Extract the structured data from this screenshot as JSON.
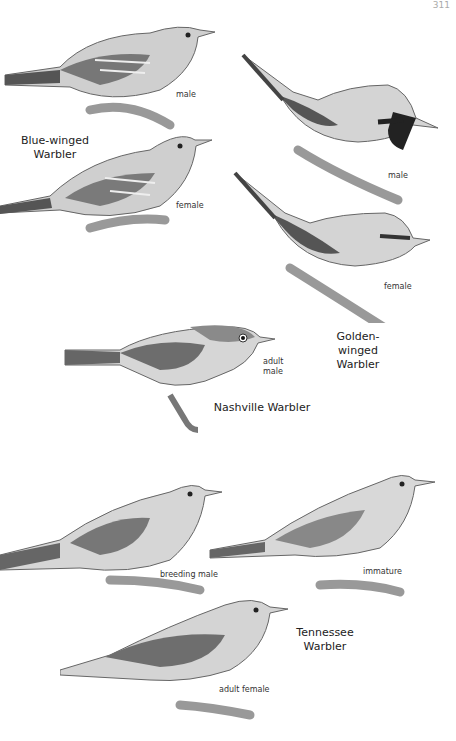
{
  "page": {
    "number": "311"
  },
  "species": [
    {
      "name_line1": "Blue-winged",
      "name_line2": "Warbler",
      "labels": [
        "male",
        "female"
      ]
    },
    {
      "name_line1": "Golden-winged",
      "name_line2": "Warbler",
      "labels": [
        "male",
        "female"
      ]
    },
    {
      "name_line1": "Nashville Warbler",
      "name_line2": "",
      "labels": [
        "adult",
        "male"
      ]
    },
    {
      "name_line1": "Tennessee",
      "name_line2": "Warbler",
      "labels": [
        "breeding male",
        "immature",
        "adult female"
      ]
    }
  ]
}
